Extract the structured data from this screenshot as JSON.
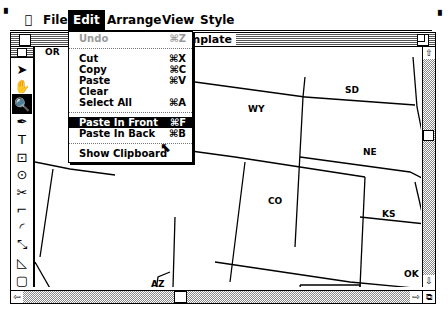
{
  "menubar": {
    "apple": "",
    "items": [
      "File",
      "Edit",
      "Arrange",
      "View",
      "Style"
    ],
    "active": "Edit"
  },
  "window": {
    "title": "t #1:usa template",
    "full_title_hint": "Untitled #1:usa template"
  },
  "edit_menu": {
    "items": [
      {
        "label": "Undo",
        "shortcut": "⌘Z",
        "disabled": true
      },
      {
        "separator": true
      },
      {
        "label": "Cut",
        "shortcut": "⌘X"
      },
      {
        "label": "Copy",
        "shortcut": "⌘C"
      },
      {
        "label": "Paste",
        "shortcut": "⌘V"
      },
      {
        "label": "Clear",
        "shortcut": ""
      },
      {
        "label": "Select All",
        "shortcut": "⌘A"
      },
      {
        "separator": true
      },
      {
        "label": "Paste In Front",
        "shortcut": "⌘F",
        "highlighted": true
      },
      {
        "label": "Paste In Back",
        "shortcut": "⌘B"
      },
      {
        "separator": true
      },
      {
        "label": "Show Clipboard",
        "shortcut": ""
      }
    ]
  },
  "tools": [
    {
      "name": "arrow-tool-icon",
      "glyph": "➤"
    },
    {
      "name": "hand-tool-icon",
      "glyph": "✋"
    },
    {
      "name": "magnifier-tool-icon",
      "glyph": "🔍",
      "selected": true
    },
    {
      "name": "pen-tool-icon",
      "glyph": "✒"
    },
    {
      "name": "text-tool-icon",
      "glyph": "T"
    },
    {
      "name": "center-rect-tool-icon",
      "glyph": "⊡"
    },
    {
      "name": "center-oval-tool-icon",
      "glyph": "⊙"
    },
    {
      "name": "scissors-tool-icon",
      "glyph": "✂"
    },
    {
      "name": "corner-tool-icon",
      "glyph": "⌐"
    },
    {
      "name": "arc-tool-icon",
      "glyph": "◜"
    },
    {
      "name": "blend-tool-icon",
      "glyph": "⤡"
    },
    {
      "name": "reflect-tool-icon",
      "glyph": "◺"
    },
    {
      "name": "rect-tool-icon",
      "glyph": "▢"
    }
  ],
  "map": {
    "labels": [
      "OR",
      "WY",
      "SD",
      "NE",
      "CO",
      "KS",
      "OK",
      "AZ"
    ]
  }
}
